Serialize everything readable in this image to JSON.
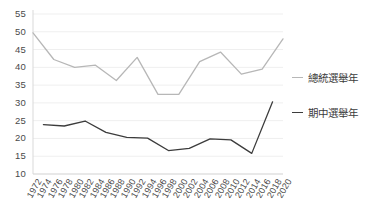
{
  "chart_data": {
    "type": "line",
    "title": "",
    "xlabel": "",
    "ylabel": "",
    "ylim": [
      10,
      55
    ],
    "ytick_step": 5,
    "yticks": [
      55,
      50,
      45,
      40,
      35,
      30,
      25,
      20,
      15,
      10
    ],
    "grid": true,
    "grid_axis": "y",
    "legend_position": "right",
    "categories": [
      "1972",
      "1974",
      "1976",
      "1978",
      "1980",
      "1982",
      "1984",
      "1986",
      "1988",
      "1990",
      "1992",
      "1994",
      "1996",
      "1998",
      "2000",
      "2002",
      "2004",
      "2006",
      "2008",
      "2010",
      "2012",
      "2014",
      "2016",
      "2018",
      "2020"
    ],
    "series": [
      {
        "name": "總統選舉年",
        "color": "#b7b7b7",
        "x": [
          "1972",
          "1976",
          "1980",
          "1984",
          "1988",
          "1992",
          "1996",
          "2000",
          "2004",
          "2008",
          "2012",
          "2016",
          "2020"
        ],
        "values": [
          49.7,
          42.2,
          40.0,
          40.6,
          36.3,
          42.8,
          32.4,
          32.4,
          41.6,
          44.3,
          38.1,
          39.5,
          48.0
        ]
      },
      {
        "name": "期中選舉年",
        "color": "#3c3c3c",
        "x": [
          "1974",
          "1978",
          "1982",
          "1986",
          "1990",
          "1994",
          "1998",
          "2002",
          "2006",
          "2010",
          "2014",
          "2018"
        ],
        "values": [
          23.9,
          23.5,
          24.9,
          21.7,
          20.3,
          20.1,
          16.6,
          17.2,
          19.9,
          19.6,
          15.8,
          30.3
        ]
      }
    ]
  },
  "legend": {
    "items": [
      {
        "label": "總統選舉年",
        "color": "#b7b7b7"
      },
      {
        "label": "期中選舉年",
        "color": "#3c3c3c"
      }
    ]
  }
}
